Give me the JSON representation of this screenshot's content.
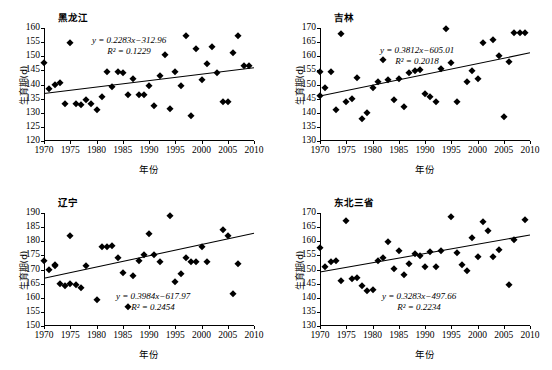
{
  "figure": {
    "axis_labels": {
      "x": "年份",
      "y": "生育期(d)"
    }
  },
  "chart_data": [
    {
      "type": "scatter",
      "title": "黑龙江",
      "xlabel": "年份",
      "ylabel": "生育期(d)",
      "xlim": [
        1970,
        2010
      ],
      "ylim": [
        120,
        160
      ],
      "xticks": [
        1970,
        1975,
        1980,
        1985,
        1990,
        1995,
        2000,
        2005,
        2010
      ],
      "yticks": [
        120,
        125,
        130,
        135,
        140,
        145,
        150,
        155,
        160
      ],
      "grid": false,
      "legend": "none",
      "equation": "y = 0.2283x−312.96",
      "r2": "R² = 0.1229",
      "slope": 0.2283,
      "intercept": -312.96,
      "r_squared": 0.1229,
      "x": [
        1970,
        1971,
        1972,
        1973,
        1974,
        1975,
        1976,
        1977,
        1978,
        1979,
        1980,
        1981,
        1982,
        1983,
        1984,
        1985,
        1986,
        1987,
        1988,
        1989,
        1990,
        1991,
        1992,
        1993,
        1994,
        1995,
        1996,
        1997,
        1998,
        1999,
        2000,
        2001,
        2002,
        2003,
        2004,
        2005,
        2006,
        2007,
        2008,
        2009
      ],
      "y": [
        147.6,
        138.4,
        140.0,
        140.6,
        133.2,
        154.8,
        133.2,
        132.8,
        134.5,
        133.0,
        130.9,
        135.5,
        144.6,
        139.0,
        144.6,
        144.2,
        136.4,
        142.1,
        136.4,
        136.4,
        139.5,
        132.5,
        143.1,
        150.3,
        131.5,
        144.6,
        139.5,
        157.3,
        128.7,
        152.4,
        141.6,
        147.3,
        153.4,
        144.2,
        133.9,
        133.9,
        151.2,
        157.2,
        146.6,
        146.6
      ]
    },
    {
      "type": "scatter",
      "title": "吉林",
      "xlabel": "年份",
      "ylabel": "生育期(d)",
      "xlim": [
        1970,
        2010
      ],
      "ylim": [
        130,
        170
      ],
      "xticks": [
        1970,
        1975,
        1980,
        1985,
        1990,
        1995,
        2000,
        2005,
        2010
      ],
      "yticks": [
        130,
        135,
        140,
        145,
        150,
        155,
        160,
        165,
        170
      ],
      "grid": false,
      "legend": "none",
      "equation": "y = 0.3812x−605.01",
      "r2": "R² = 0.2018",
      "slope": 0.3812,
      "intercept": -605.01,
      "r_squared": 0.2018,
      "x": [
        1970,
        1970,
        1971,
        1972,
        1973,
        1974,
        1975,
        1976,
        1977,
        1978,
        1979,
        1980,
        1981,
        1982,
        1983,
        1984,
        1985,
        1986,
        1987,
        1988,
        1989,
        1990,
        1991,
        1992,
        1993,
        1994,
        1995,
        1996,
        1998,
        1999,
        2000,
        2001,
        2003,
        2004,
        2005,
        2006,
        2007,
        2008,
        2009
      ],
      "y": [
        154.6,
        145.8,
        148.6,
        154.4,
        141.0,
        167.8,
        143.9,
        145.0,
        152.2,
        137.8,
        139.8,
        148.9,
        150.8,
        158.7,
        151.5,
        144.6,
        152.0,
        142.1,
        154.2,
        154.9,
        155.0,
        146.6,
        145.7,
        143.8,
        155.5,
        169.5,
        157.5,
        143.7,
        150.9,
        154.7,
        151.8,
        164.8,
        165.7,
        160.1,
        138.5,
        158.1,
        168.2,
        168.2,
        168.2
      ]
    },
    {
      "type": "scatter",
      "title": "辽宁",
      "xlabel": "年份",
      "ylabel": "生育期(d)",
      "xlim": [
        1970,
        2010
      ],
      "ylim": [
        150,
        190
      ],
      "xticks": [
        1970,
        1975,
        1980,
        1985,
        1990,
        1995,
        2000,
        2005,
        2010
      ],
      "yticks": [
        150,
        155,
        160,
        165,
        170,
        175,
        180,
        185,
        190
      ],
      "grid": false,
      "legend": "none",
      "equation": "y = 0.3984x−617.97",
      "r2": "R² = 0.2454",
      "slope": 0.3984,
      "intercept": -617.97,
      "r_squared": 0.2454,
      "x": [
        1970,
        1971,
        1972,
        1972,
        1973,
        1974,
        1975,
        1975,
        1976,
        1977,
        1978,
        1980,
        1981,
        1982,
        1983,
        1984,
        1985,
        1986,
        1987,
        1988,
        1989,
        1990,
        1991,
        1992,
        1994,
        1995,
        1996,
        1997,
        1998,
        1999,
        2000,
        2001,
        2004,
        2005,
        2006,
        2007
      ],
      "y": [
        173.1,
        169.9,
        171.3,
        171.5,
        164.9,
        164.3,
        164.8,
        181.9,
        164.4,
        163.5,
        171.2,
        159.2,
        178.1,
        178.1,
        178.3,
        174.0,
        168.7,
        156.9,
        167.6,
        173.0,
        175.0,
        182.7,
        175.3,
        172.7,
        188.8,
        165.6,
        168.3,
        174.0,
        172.7,
        172.6,
        178.1,
        172.6,
        183.9,
        181.7,
        161.2,
        172.1
      ]
    },
    {
      "type": "scatter",
      "title": "东北三省",
      "xlabel": "年份",
      "ylabel": "生育期(d)",
      "xlim": [
        1970,
        2010
      ],
      "ylim": [
        130,
        170
      ],
      "xticks": [
        1970,
        1975,
        1980,
        1985,
        1990,
        1995,
        2000,
        2005,
        2010
      ],
      "yticks": [
        130,
        135,
        140,
        145,
        150,
        155,
        160,
        165,
        170
      ],
      "grid": false,
      "legend": "none",
      "equation": "y = 0.3283x−497.66",
      "r2": "R² = 0.2234",
      "slope": 0.3283,
      "intercept": -497.66,
      "r_squared": 0.2234,
      "x": [
        1970,
        1971,
        1972,
        1973,
        1974,
        1975,
        1976,
        1977,
        1978,
        1979,
        1980,
        1981,
        1982,
        1983,
        1984,
        1985,
        1986,
        1987,
        1988,
        1989,
        1990,
        1991,
        1992,
        1993,
        1995,
        1996,
        1997,
        1998,
        1999,
        2000,
        2001,
        2002,
        2003,
        2004,
        2006,
        2007,
        2009
      ],
      "y": [
        157.6,
        151.0,
        152.7,
        153.1,
        146.0,
        167.0,
        146.8,
        147.0,
        144.0,
        142.5,
        142.6,
        153.0,
        154.1,
        159.9,
        150.3,
        156.4,
        147.9,
        152.0,
        155.6,
        154.7,
        150.9,
        156.3,
        150.9,
        156.7,
        168.7,
        155.8,
        151.5,
        149.5,
        161.3,
        154.6,
        166.9,
        163.6,
        154.6,
        157.0,
        144.6,
        160.4,
        167.4
      ]
    }
  ]
}
